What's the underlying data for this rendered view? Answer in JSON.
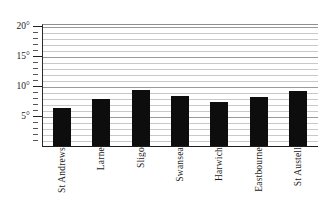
{
  "chart_data": {
    "type": "bar",
    "title": "",
    "subtitle": "",
    "xlabel": "",
    "ylabel": "",
    "categories": [
      "St Andrews",
      "Larne",
      "Sligo",
      "Swansea",
      "Harwich",
      "Eastbourne",
      "St Austell"
    ],
    "values": [
      6.5,
      8.0,
      9.5,
      8.5,
      7.5,
      8.2,
      9.2
    ],
    "unit": "°",
    "ylim": [
      0,
      21
    ],
    "y_major_ticks": [
      5,
      10,
      15,
      20
    ],
    "y_major_tick_labels": [
      "5°",
      "10°",
      "15°",
      "20°"
    ],
    "y_minor_tick_interval": 1,
    "gridlines": true,
    "grid_interval": 1,
    "legend": "none",
    "bar_color": "#0d0d0d",
    "grid_color": "#c9c9c9",
    "axis_color": "#1d1d1d",
    "background": "#ffffff"
  }
}
